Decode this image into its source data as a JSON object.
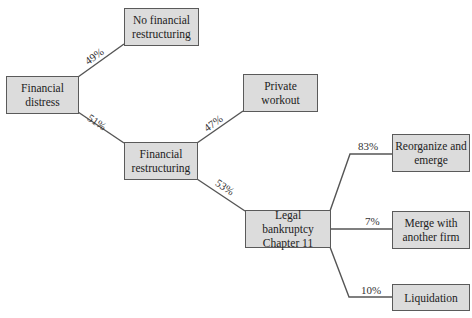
{
  "diagram": {
    "nodes": {
      "financial_distress": {
        "line1": "Financial",
        "line2": "distress"
      },
      "no_restructuring": {
        "line1": "No financial",
        "line2": "restructuring"
      },
      "financial_restructuring": {
        "line1": "Financial",
        "line2": "restructuring"
      },
      "private_workout": {
        "line1": "Private",
        "line2": "workout"
      },
      "legal_bankruptcy": {
        "line1": "Legal bankruptcy",
        "line2": "Chapter 11"
      },
      "reorganize": {
        "line1": "Reorganize and",
        "line2": "emerge"
      },
      "merge": {
        "line1": "Merge with",
        "line2": "another firm"
      },
      "liquidation": {
        "line1": "Liquidation"
      }
    },
    "edges": {
      "distress_to_no_restructuring": "49%",
      "distress_to_restructuring": "51%",
      "restructuring_to_private_workout": "47%",
      "restructuring_to_legal_bankruptcy": "53%",
      "bankruptcy_to_reorganize": "83%",
      "bankruptcy_to_merge": "7%",
      "bankruptcy_to_liquidation": "10%"
    },
    "colors": {
      "box_fill": "#dcdcdc",
      "box_border": "#5a5a5a",
      "line": "#555555"
    }
  }
}
